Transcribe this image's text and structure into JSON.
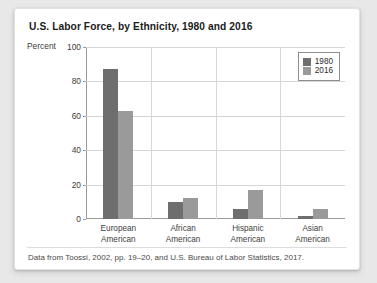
{
  "card": {
    "title": "U.S. Labor Force, by Ethnicity, 1980 and 2016",
    "source_note": "Data from Toossi, 2002, pp. 19–20, and U.S. Bureau of Labor Statistics, 2017."
  },
  "colors": {
    "series_1980": "#6e6e6e",
    "series_2016": "#9a9a9a",
    "gridline": "#d6d6d6",
    "axis": "#9a9a9a",
    "card_background": "#ffffff",
    "page_background": "#e8e8e8",
    "title_text": "#1b1b1b",
    "label_text": "#3d3d3d"
  },
  "chart_data": {
    "type": "bar",
    "title": "U.S. Labor Force, by Ethnicity, 1980 and 2016",
    "xlabel": "",
    "ylabel": "Percent",
    "ylim": [
      0,
      100
    ],
    "yticks": [
      0,
      20,
      40,
      60,
      80,
      100
    ],
    "grid": true,
    "legend_position": "top-right",
    "categories": [
      "European American",
      "African American",
      "Hispanic American",
      "Asian American"
    ],
    "category_lines": [
      [
        "European",
        "American"
      ],
      [
        "African",
        "American"
      ],
      [
        "Hispanic",
        "American"
      ],
      [
        "Asian",
        "American"
      ]
    ],
    "series": [
      {
        "name": "1980",
        "color": "#6e6e6e",
        "values": [
          87,
          10,
          6,
          2
        ]
      },
      {
        "name": "2016",
        "color": "#9a9a9a",
        "values": [
          63,
          12,
          17,
          6
        ]
      }
    ]
  }
}
